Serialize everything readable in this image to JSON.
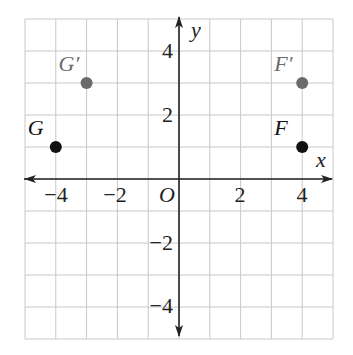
{
  "diagram": {
    "type": "coordinate-plane",
    "x_range": [
      -5,
      5
    ],
    "y_range": [
      -5,
      5
    ],
    "grid_step": 1,
    "axes": {
      "x_label": "x",
      "y_label": "y",
      "origin_label": "O"
    },
    "x_ticks": [
      {
        "value": -4,
        "label": "−4"
      },
      {
        "value": -2,
        "label": "−2"
      },
      {
        "value": 2,
        "label": "2"
      },
      {
        "value": 4,
        "label": "4"
      }
    ],
    "y_ticks": [
      {
        "value": 4,
        "label": "4"
      },
      {
        "value": 2,
        "label": "2"
      },
      {
        "value": -2,
        "label": "−2"
      },
      {
        "value": -4,
        "label": "−4"
      }
    ],
    "points": [
      {
        "name": "G",
        "label": "G",
        "x": -4,
        "y": 1,
        "color": "#111111",
        "label_color": "#111111"
      },
      {
        "name": "G-prime",
        "label": "G′",
        "x": -3,
        "y": 3,
        "color": "#6b6b6b",
        "label_color": "#6b6b6b"
      },
      {
        "name": "F",
        "label": "F",
        "x": 4,
        "y": 1,
        "color": "#111111",
        "label_color": "#111111"
      },
      {
        "name": "F-prime",
        "label": "F′",
        "x": 4,
        "y": 3,
        "color": "#6b6b6b",
        "label_color": "#6b6b6b"
      }
    ],
    "colors": {
      "grid": "#c8c8c8",
      "axis": "#222222"
    }
  }
}
